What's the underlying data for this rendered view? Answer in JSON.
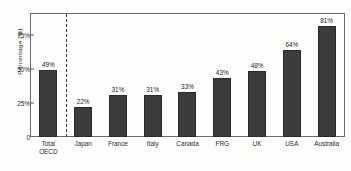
{
  "chart_data": {
    "type": "bar",
    "title": "",
    "xlabel": "",
    "ylabel": "Percentage (%)",
    "ylim": [
      0,
      90
    ],
    "grid": false,
    "legend": null,
    "categories": [
      "Total OECD",
      "Japan",
      "France",
      "Italy",
      "Canada",
      "FRG",
      "UK",
      "USA",
      "Australia"
    ],
    "category_lines": [
      [
        "Total",
        "OECD"
      ],
      [
        "Japan"
      ],
      [
        "France"
      ],
      [
        "Italy"
      ],
      [
        "Canada"
      ],
      [
        "FRG"
      ],
      [
        "UK"
      ],
      [
        "USA"
      ],
      [
        "Australia"
      ]
    ],
    "values": [
      49,
      22,
      31,
      31,
      33,
      43,
      48,
      64,
      81
    ],
    "value_labels": [
      "49%",
      "22%",
      "31%",
      "31%",
      "33%",
      "43%",
      "48%",
      "64%",
      "81%"
    ],
    "yticks": [
      0,
      25,
      50,
      75
    ],
    "ytick_labels": [
      "0",
      "25%",
      "50%",
      "75%"
    ],
    "annotations": [
      {
        "name": "group-divider",
        "type": "dashed-vertical-line",
        "after_category": "Total OECD"
      }
    ],
    "colors": {
      "bar": "#3b3b3b",
      "bar_edge": "#2a2a2a",
      "axis": "#6a6a6a",
      "text": "#2b2b2b",
      "background": "#fdfdfc",
      "divider": "#333333"
    }
  }
}
